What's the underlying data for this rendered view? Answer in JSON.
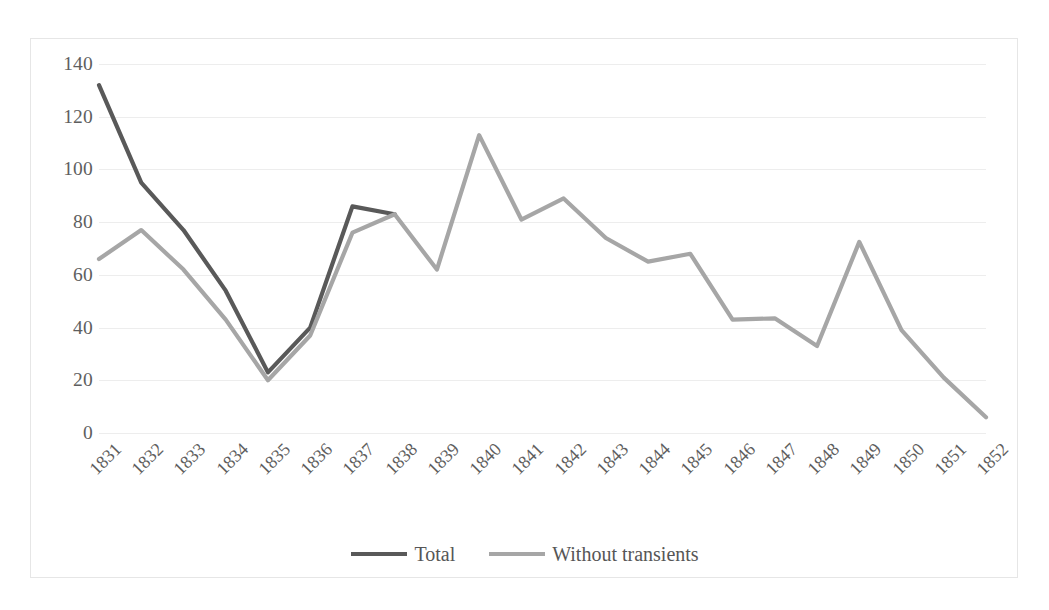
{
  "chart_data": {
    "type": "line",
    "title": "",
    "xlabel": "",
    "ylabel": "",
    "x": [
      "1831",
      "1832",
      "1833",
      "1834",
      "1835",
      "1836",
      "1837",
      "1838",
      "1839",
      "1840",
      "1841",
      "1842",
      "1843",
      "1844",
      "1845",
      "1846",
      "1847",
      "1848",
      "1849",
      "1850",
      "1851",
      "1852"
    ],
    "categories": [
      "1831",
      "1832",
      "1833",
      "1834",
      "1835",
      "1836",
      "1837",
      "1838",
      "1839",
      "1840",
      "1841",
      "1842",
      "1843",
      "1844",
      "1845",
      "1846",
      "1847",
      "1848",
      "1849",
      "1850",
      "1851",
      "1852"
    ],
    "yticks": [
      0,
      20,
      40,
      60,
      80,
      100,
      120,
      140
    ],
    "ylim": [
      0,
      140
    ],
    "grid": true,
    "legend_position": "bottom",
    "series": [
      {
        "name": "Total",
        "color": "#595959",
        "values": [
          132,
          95,
          77,
          54,
          23,
          40,
          86,
          83,
          null,
          null,
          null,
          null,
          null,
          null,
          null,
          null,
          null,
          null,
          null,
          null,
          null,
          null
        ]
      },
      {
        "name": "Without transients",
        "color": "#a6a6a6",
        "values": [
          66,
          77,
          62,
          43,
          20,
          37,
          76,
          83,
          62,
          113,
          81,
          89,
          74,
          65,
          68,
          43,
          43.5,
          33,
          72.5,
          39,
          21,
          6
        ]
      }
    ]
  },
  "legend": {
    "items": [
      {
        "label": "Total",
        "color": "#595959"
      },
      {
        "label": "Without transients",
        "color": "#a6a6a6"
      }
    ]
  },
  "axis": {
    "y_labels": [
      "140",
      "120",
      "100",
      "80",
      "60",
      "40",
      "20",
      "0"
    ],
    "x_labels": [
      "1831",
      "1832",
      "1833",
      "1834",
      "1835",
      "1836",
      "1837",
      "1838",
      "1839",
      "1840",
      "1841",
      "1842",
      "1843",
      "1844",
      "1845",
      "1846",
      "1847",
      "1848",
      "1849",
      "1850",
      "1851",
      "1852"
    ]
  },
  "style": {
    "plot_border_color": "#e6e6e6",
    "gridline_color": "#ededed",
    "tick_text_color": "#5e5e5e",
    "background": "#ffffff"
  }
}
